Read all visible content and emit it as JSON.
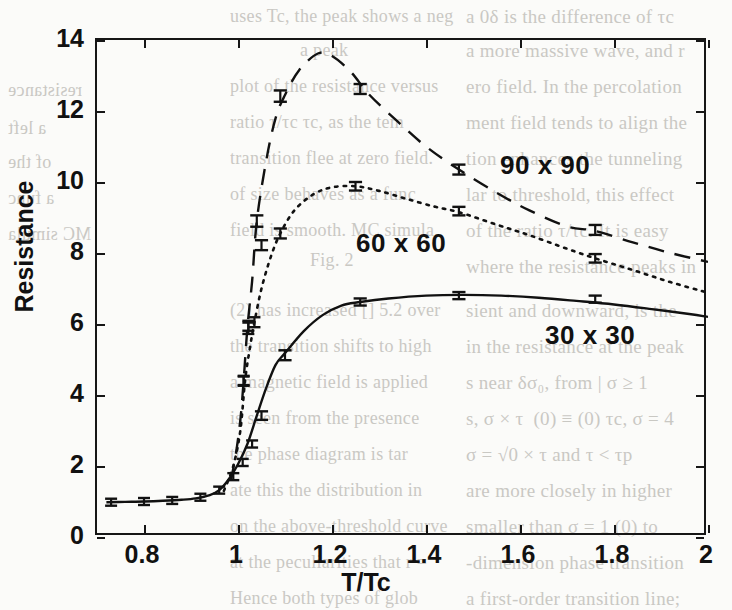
{
  "page": {
    "kind": "scanned-journal-page-figure",
    "ghost_text": [
      {
        "t": "a 0δ is the difference of τc",
        "x": 466,
        "y": 6,
        "size": 19,
        "flip": false
      },
      {
        "t": "a more massive wave, and r",
        "x": 466,
        "y": 40,
        "size": 19,
        "flip": false
      },
      {
        "t": "ero field. In the percolation",
        "x": 466,
        "y": 76,
        "size": 19,
        "flip": false
      },
      {
        "t": "ment field tends to align the",
        "x": 466,
        "y": 112,
        "size": 19,
        "flip": false
      },
      {
        "t": "tion enhances the tunneling",
        "x": 466,
        "y": 148,
        "size": 19,
        "flip": false
      },
      {
        "t": "lar to threshold, this effect",
        "x": 466,
        "y": 184,
        "size": 19,
        "flip": false
      },
      {
        "t": "of the ratio τ/τc. It is easy",
        "x": 466,
        "y": 220,
        "size": 19,
        "flip": false
      },
      {
        "t": "where the resistance peaks in",
        "x": 466,
        "y": 256,
        "size": 19,
        "flip": false
      },
      {
        "t": "sient and downward, is the",
        "x": 466,
        "y": 300,
        "size": 19,
        "flip": false
      },
      {
        "t": "in the resistance at the peak",
        "x": 466,
        "y": 336,
        "size": 19,
        "flip": false
      },
      {
        "t": "s near δσ₀, from | σ ≥ 1",
        "x": 466,
        "y": 372,
        "size": 19,
        "flip": false
      },
      {
        "t": "s, σ × τ ⁡ (0) ≡ (0) τc, σ = 4",
        "x": 466,
        "y": 408,
        "size": 19,
        "flip": false
      },
      {
        "t": "σ = √0 × τ and τ < τp",
        "x": 466,
        "y": 444,
        "size": 19,
        "flip": false
      },
      {
        "t": "are more closely in higher",
        "x": 466,
        "y": 480,
        "size": 19,
        "flip": false
      },
      {
        "t": "smaller than σ = 1 (0) to",
        "x": 466,
        "y": 516,
        "size": 19,
        "flip": false
      },
      {
        "t": "-dimension phase transition",
        "x": 466,
        "y": 552,
        "size": 19,
        "flip": false
      },
      {
        "t": "a first-order transition line;",
        "x": 466,
        "y": 588,
        "size": 19,
        "flip": false
      },
      {
        "t": "uses Tc, the peak shows a neg",
        "x": 230,
        "y": 6,
        "size": 18,
        "flip": false
      },
      {
        "t": "a peak",
        "x": 300,
        "y": 40,
        "size": 18,
        "flip": false
      },
      {
        "t": "plot of the resistance versus",
        "x": 230,
        "y": 76,
        "size": 18,
        "flip": false
      },
      {
        "t": "ratio  τ/τc  τc, as the tem",
        "x": 230,
        "y": 112,
        "size": 18,
        "flip": false
      },
      {
        "t": "transition flee at zero field.",
        "x": 230,
        "y": 148,
        "size": 18,
        "flip": false
      },
      {
        "t": "of size behaves as a func",
        "x": 230,
        "y": 184,
        "size": 18,
        "flip": false
      },
      {
        "t": "field is smooth. MC simula",
        "x": 230,
        "y": 220,
        "size": 18,
        "flip": false
      },
      {
        "t": "Fig. 2",
        "x": 310,
        "y": 250,
        "size": 18,
        "flip": false
      },
      {
        "t": "(2) has increased [] 5.2 over",
        "x": 230,
        "y": 300,
        "size": 18,
        "flip": false
      },
      {
        "t": "the transition shifts to high",
        "x": 230,
        "y": 336,
        "size": 18,
        "flip": false
      },
      {
        "t": "a magnetic field is applied",
        "x": 230,
        "y": 372,
        "size": 18,
        "flip": false
      },
      {
        "t": "is seen from the presence",
        "x": 230,
        "y": 408,
        "size": 18,
        "flip": false
      },
      {
        "t": "the phase diagram is tar",
        "x": 230,
        "y": 444,
        "size": 18,
        "flip": false
      },
      {
        "t": "ate this the distribution in",
        "x": 230,
        "y": 480,
        "size": 18,
        "flip": false
      },
      {
        "t": "on the above-threshold curve",
        "x": 230,
        "y": 516,
        "size": 18,
        "flip": false
      },
      {
        "t": "at the peculiarities that r =",
        "x": 230,
        "y": 552,
        "size": 18,
        "flip": false
      },
      {
        "t": "Hence both types of glob",
        "x": 230,
        "y": 588,
        "size": 18,
        "flip": false
      },
      {
        "t": "a left",
        "x": 8,
        "y": 118,
        "size": 18,
        "flip": true
      },
      {
        "t": "resistance",
        "x": 8,
        "y": 80,
        "size": 18,
        "flip": true
      },
      {
        "t": "of the",
        "x": 8,
        "y": 152,
        "size": 18,
        "flip": true
      },
      {
        "t": "a func",
        "x": 8,
        "y": 188,
        "size": 18,
        "flip": true
      },
      {
        "t": "MC simula",
        "x": 8,
        "y": 224,
        "size": 18,
        "flip": true
      }
    ]
  },
  "chart_data": {
    "type": "line",
    "title": "",
    "xlabel": "T/Tc",
    "ylabel": "Resistance",
    "xlim": [
      0.7,
      2.0
    ],
    "ylim": [
      0,
      14
    ],
    "xticks": [
      0.8,
      1,
      1.2,
      1.4,
      1.6,
      1.8,
      2
    ],
    "xtick_labels": [
      "0.8",
      "1",
      "1.2",
      "1.4",
      "1.6",
      "1.8",
      "2"
    ],
    "yticks": [
      0,
      2,
      4,
      6,
      8,
      10,
      12,
      14
    ],
    "ytick_labels": [
      "0",
      "2",
      "4",
      "6",
      "8",
      "10",
      "12",
      "14"
    ],
    "grid": false,
    "legend_position": "inline-annotations",
    "series": [
      {
        "name": "30 x 30",
        "label": "30 x 30",
        "linestyle": "solid",
        "color": "#111111",
        "label_pos": {
          "x": 545,
          "y": 320
        },
        "curve": [
          [
            0.72,
            0.98
          ],
          [
            0.76,
            0.99
          ],
          [
            0.8,
            1.0
          ],
          [
            0.84,
            1.02
          ],
          [
            0.88,
            1.05
          ],
          [
            0.91,
            1.09
          ],
          [
            0.94,
            1.18
          ],
          [
            0.96,
            1.32
          ],
          [
            0.98,
            1.62
          ],
          [
            1.0,
            2.05
          ],
          [
            1.02,
            2.62
          ],
          [
            1.04,
            3.42
          ],
          [
            1.06,
            4.2
          ],
          [
            1.08,
            4.85
          ],
          [
            1.1,
            5.18
          ],
          [
            1.14,
            5.8
          ],
          [
            1.18,
            6.25
          ],
          [
            1.22,
            6.52
          ],
          [
            1.26,
            6.62
          ],
          [
            1.32,
            6.72
          ],
          [
            1.4,
            6.8
          ],
          [
            1.48,
            6.82
          ],
          [
            1.56,
            6.8
          ],
          [
            1.64,
            6.74
          ],
          [
            1.72,
            6.65
          ],
          [
            1.8,
            6.55
          ],
          [
            1.88,
            6.42
          ],
          [
            1.96,
            6.28
          ],
          [
            2.0,
            6.2
          ]
        ],
        "points": [
          {
            "x": 0.73,
            "y": 0.98,
            "yerr": 0.05,
            "xerr": 0.012
          },
          {
            "x": 0.8,
            "y": 1.0,
            "yerr": 0.05,
            "xerr": 0.012
          },
          {
            "x": 0.86,
            "y": 1.03,
            "yerr": 0.05,
            "xerr": 0.012
          },
          {
            "x": 0.92,
            "y": 1.12,
            "yerr": 0.06,
            "xerr": 0.012
          },
          {
            "x": 0.96,
            "y": 1.32,
            "yerr": 0.06,
            "xerr": 0.012
          },
          {
            "x": 0.99,
            "y": 1.7,
            "yerr": 0.08,
            "xerr": 0.012
          },
          {
            "x": 1.01,
            "y": 2.1,
            "yerr": 0.1,
            "xerr": 0.012
          },
          {
            "x": 1.03,
            "y": 2.62,
            "yerr": 0.1,
            "xerr": 0.012
          },
          {
            "x": 1.05,
            "y": 3.42,
            "yerr": 0.12,
            "xerr": 0.014
          },
          {
            "x": 1.1,
            "y": 5.12,
            "yerr": 0.14,
            "xerr": 0.014
          },
          {
            "x": 1.26,
            "y": 6.62,
            "yerr": 0.1,
            "xerr": 0.014
          },
          {
            "x": 1.47,
            "y": 6.8,
            "yerr": 0.1,
            "xerr": 0.014
          },
          {
            "x": 1.76,
            "y": 6.7,
            "yerr": 0.1,
            "xerr": 0.014
          }
        ]
      },
      {
        "name": "60 x 60",
        "label": "60 x 60",
        "linestyle": "dotted",
        "color": "#111111",
        "label_pos": {
          "x": 356,
          "y": 228
        },
        "curve": [
          [
            0.97,
            1.3
          ],
          [
            0.99,
            2.0
          ],
          [
            1.005,
            3.0
          ],
          [
            1.015,
            4.4
          ],
          [
            1.025,
            5.3
          ],
          [
            1.035,
            6.05
          ],
          [
            1.05,
            7.0
          ],
          [
            1.07,
            7.9
          ],
          [
            1.09,
            8.55
          ],
          [
            1.12,
            9.2
          ],
          [
            1.16,
            9.65
          ],
          [
            1.2,
            9.85
          ],
          [
            1.25,
            9.88
          ],
          [
            1.3,
            9.75
          ],
          [
            1.36,
            9.52
          ],
          [
            1.42,
            9.3
          ],
          [
            1.47,
            9.15
          ],
          [
            1.55,
            8.8
          ],
          [
            1.62,
            8.5
          ],
          [
            1.7,
            8.12
          ],
          [
            1.76,
            7.85
          ],
          [
            1.84,
            7.52
          ],
          [
            1.92,
            7.18
          ],
          [
            2.0,
            6.88
          ]
        ],
        "points": [
          {
            "x": 1.012,
            "y": 4.4,
            "yerr": 0.12,
            "xerr": 0.012
          },
          {
            "x": 1.022,
            "y": 5.95,
            "yerr": 0.14,
            "xerr": 0.012
          },
          {
            "x": 1.035,
            "y": 6.05,
            "yerr": 0.14,
            "xerr": 0.012
          },
          {
            "x": 1.05,
            "y": 8.22,
            "yerr": 0.14,
            "xerr": 0.014
          },
          {
            "x": 1.09,
            "y": 8.55,
            "yerr": 0.14,
            "xerr": 0.014
          },
          {
            "x": 1.25,
            "y": 9.88,
            "yerr": 0.12,
            "xerr": 0.014
          },
          {
            "x": 1.47,
            "y": 9.18,
            "yerr": 0.12,
            "xerr": 0.014
          },
          {
            "x": 1.76,
            "y": 7.85,
            "yerr": 0.12,
            "xerr": 0.014
          }
        ]
      },
      {
        "name": "90 x 90",
        "label": "90 x 90",
        "linestyle": "dashed",
        "color": "#111111",
        "label_pos": {
          "x": 500,
          "y": 150
        },
        "curve": [
          [
            0.985,
            1.6
          ],
          [
            0.995,
            2.3
          ],
          [
            1.005,
            3.3
          ],
          [
            1.012,
            4.4
          ],
          [
            1.02,
            5.9
          ],
          [
            1.03,
            7.2
          ],
          [
            1.04,
            8.9
          ],
          [
            1.06,
            10.6
          ],
          [
            1.08,
            11.8
          ],
          [
            1.1,
            12.45
          ],
          [
            1.13,
            13.15
          ],
          [
            1.17,
            13.62
          ],
          [
            1.2,
            13.55
          ],
          [
            1.24,
            13.1
          ],
          [
            1.28,
            12.45
          ],
          [
            1.34,
            11.7
          ],
          [
            1.4,
            11.0
          ],
          [
            1.47,
            10.35
          ],
          [
            1.55,
            9.7
          ],
          [
            1.62,
            9.2
          ],
          [
            1.7,
            8.75
          ],
          [
            1.76,
            8.62
          ],
          [
            1.84,
            8.3
          ],
          [
            1.92,
            8.0
          ],
          [
            2.0,
            7.75
          ]
        ],
        "points": [
          {
            "x": 1.012,
            "y": 4.4,
            "yerr": 0.14,
            "xerr": 0.012
          },
          {
            "x": 1.022,
            "y": 5.88,
            "yerr": 0.16,
            "xerr": 0.012
          },
          {
            "x": 1.04,
            "y": 8.9,
            "yerr": 0.16,
            "xerr": 0.014
          },
          {
            "x": 1.09,
            "y": 12.42,
            "yerr": 0.16,
            "xerr": 0.014
          },
          {
            "x": 1.26,
            "y": 12.62,
            "yerr": 0.14,
            "xerr": 0.014
          },
          {
            "x": 1.47,
            "y": 10.35,
            "yerr": 0.14,
            "xerr": 0.014
          },
          {
            "x": 1.76,
            "y": 8.65,
            "yerr": 0.14,
            "xerr": 0.014
          }
        ]
      }
    ]
  }
}
